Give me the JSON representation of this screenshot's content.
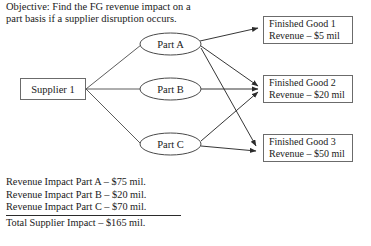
{
  "objective": {
    "text": "Objective: Find the FG revenue impact on a part basis if a supplier disruption occurs."
  },
  "diagram": {
    "supplier": {
      "label": "Supplier 1"
    },
    "parts": [
      {
        "id": "part-a",
        "label": "Part A"
      },
      {
        "id": "part-b",
        "label": "Part B"
      },
      {
        "id": "part-c",
        "label": "Part C"
      }
    ],
    "finished_goods": [
      {
        "id": "fg-1",
        "name": "Finished Good 1",
        "revenue": "Revenue – $5 mil"
      },
      {
        "id": "fg-2",
        "name": "Finished Good 2",
        "revenue": "Revenue – $20 mil"
      },
      {
        "id": "fg-3",
        "name": "Finished Good 3",
        "revenue": "Revenue – $50 mil"
      }
    ],
    "edges": [
      {
        "from": "supplier",
        "to": "part-a",
        "arrow": false
      },
      {
        "from": "supplier",
        "to": "part-b",
        "arrow": false
      },
      {
        "from": "supplier",
        "to": "part-c",
        "arrow": false
      },
      {
        "from": "part-a",
        "to": "fg-1",
        "arrow": true
      },
      {
        "from": "part-a",
        "to": "fg-2",
        "arrow": true
      },
      {
        "from": "part-a",
        "to": "fg-3",
        "arrow": true
      },
      {
        "from": "part-b",
        "to": "fg-2",
        "arrow": true
      },
      {
        "from": "part-c",
        "to": "fg-2",
        "arrow": true
      },
      {
        "from": "part-c",
        "to": "fg-3",
        "arrow": true
      }
    ]
  },
  "impact_summary": {
    "rows": [
      "Revenue Impact Part A – $75 mil.",
      "Revenue Impact Part B – $20 mil.",
      "Revenue Impact Part C – $70 mil."
    ],
    "total": "Total Supplier Impact – $165 mil."
  },
  "colors": {
    "stroke": "#3a3a3a",
    "box_border": "#6b6b6b",
    "text": "#1a1a1a",
    "background": "#ffffff"
  }
}
